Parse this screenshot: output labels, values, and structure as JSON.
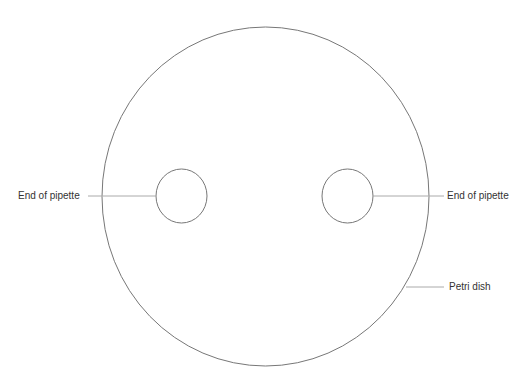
{
  "diagram": {
    "labels": {
      "left_pipette": "End of pipette",
      "right_pipette": "End of pipette",
      "petri_dish": "Petri dish"
    },
    "colors": {
      "outline": "#777777",
      "leader": "#aaaaaa",
      "text": "#333333",
      "background": "#ffffff"
    }
  }
}
